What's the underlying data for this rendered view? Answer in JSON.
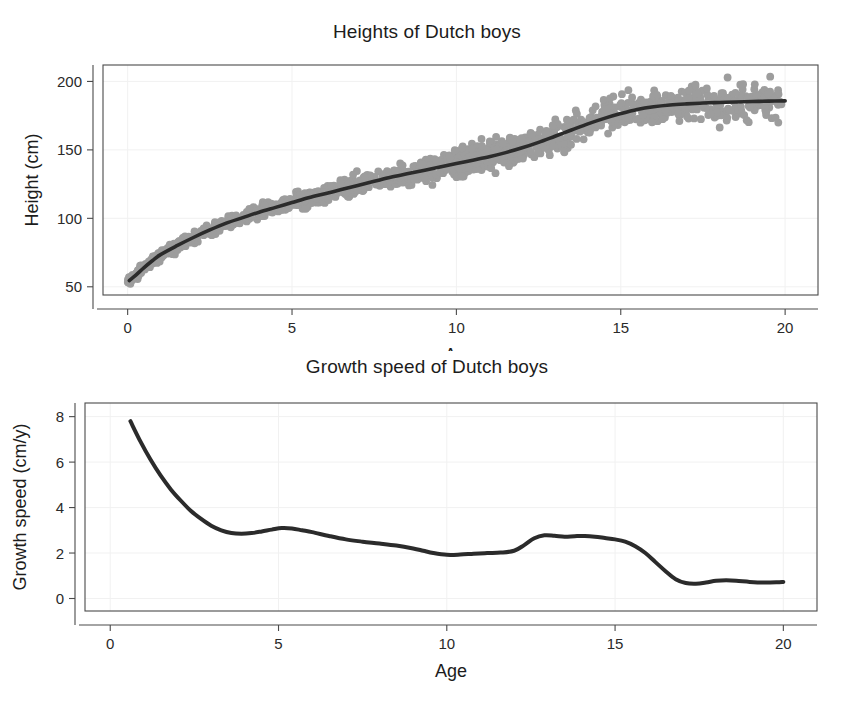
{
  "figure": {
    "background": "#ffffff",
    "width": 854,
    "height": 702
  },
  "colors": {
    "point": "#9d9d9d",
    "curve": "#2b2b2b",
    "axis": "#4a4a4a",
    "grid": "#f1f1f1",
    "text": "#1c1c1c"
  },
  "panels": {
    "heights": {
      "title": "Heights of Dutch boys",
      "xlabel": "Age",
      "ylabel": "Height (cm)",
      "xticks": [
        "0",
        "5",
        "10",
        "15",
        "20"
      ],
      "yticks": [
        "50",
        "100",
        "150",
        "200"
      ]
    },
    "growth": {
      "title": "Growth speed of Dutch boys",
      "xlabel": "Age",
      "ylabel": "Growth speed (cm/y)",
      "xticks": [
        "0",
        "5",
        "10",
        "15",
        "20"
      ],
      "yticks": [
        "0",
        "2",
        "4",
        "6",
        "8"
      ]
    }
  },
  "chart_data": [
    {
      "type": "scatter",
      "id": "heights",
      "title": "Heights of Dutch boys",
      "xlabel": "Age",
      "ylabel": "Height (cm)",
      "xlim": [
        -0.75,
        21.0
      ],
      "ylim": [
        44.0,
        212.0
      ],
      "xticks": [
        0,
        5,
        10,
        15,
        20
      ],
      "yticks": [
        50,
        100,
        150,
        200
      ],
      "grid": true,
      "legend": "none",
      "point_color": "#9d9d9d",
      "point_size": 4.0,
      "series": [
        {
          "name": "Fitted smooth (height vs age)",
          "type": "line",
          "color": "#2b2b2b",
          "x": [
            0.05,
            0.25,
            0.5,
            0.75,
            1.0,
            1.5,
            2.0,
            2.5,
            3.0,
            3.5,
            4.0,
            4.5,
            5.0,
            5.5,
            6.0,
            6.5,
            7.0,
            7.5,
            8.0,
            8.5,
            9.0,
            9.5,
            10.0,
            10.5,
            11.0,
            11.5,
            12.0,
            12.5,
            13.0,
            13.5,
            14.0,
            14.5,
            15.0,
            15.5,
            16.0,
            16.5,
            17.0,
            17.5,
            18.0,
            18.5,
            19.0,
            19.5,
            20.0
          ],
          "y": [
            54.5,
            58.5,
            64.0,
            69.0,
            73.5,
            80.0,
            86.0,
            91.5,
            96.5,
            100.5,
            104.5,
            108.0,
            111.5,
            115.0,
            118.0,
            121.0,
            124.0,
            127.0,
            130.0,
            132.5,
            135.0,
            137.5,
            140.0,
            142.5,
            145.0,
            148.0,
            151.5,
            155.5,
            160.0,
            164.5,
            169.0,
            173.0,
            176.5,
            179.5,
            181.5,
            182.8,
            183.6,
            184.2,
            184.6,
            185.0,
            185.3,
            185.6,
            185.8
          ]
        },
        {
          "name": "Observed boys (scatter, n≈1400)",
          "type": "scatter",
          "color": "#9d9d9d",
          "note": "Individual measurements scattered around the fitted curve; spread grows with age, roughly +/-4 cm at age 1 and +/-9 cm after age 14."
        }
      ]
    },
    {
      "type": "line",
      "id": "growth",
      "title": "Growth speed of Dutch boys",
      "xlabel": "Age",
      "ylabel": "Growth speed (cm/y)",
      "xlim": [
        -0.75,
        21.0
      ],
      "ylim": [
        -0.55,
        8.6
      ],
      "xticks": [
        0,
        5,
        10,
        15,
        20
      ],
      "yticks": [
        0,
        2,
        4,
        6,
        8
      ],
      "grid": true,
      "legend": "none",
      "series": [
        {
          "name": "Growth velocity (derivative of fitted height curve)",
          "color": "#2b2b2b",
          "x": [
            0.6,
            0.9,
            1.2,
            1.5,
            1.8,
            2.1,
            2.4,
            2.7,
            3.0,
            3.3,
            3.6,
            3.9,
            4.2,
            4.5,
            4.8,
            5.1,
            5.4,
            5.7,
            6.0,
            6.5,
            7.0,
            7.5,
            8.0,
            8.5,
            9.0,
            9.3,
            9.6,
            10.0,
            10.4,
            10.8,
            11.2,
            11.6,
            12.0,
            12.3,
            12.6,
            12.9,
            13.2,
            13.5,
            13.8,
            14.1,
            14.4,
            14.7,
            15.0,
            15.3,
            15.6,
            15.9,
            16.2,
            16.5,
            16.8,
            17.1,
            17.4,
            17.7,
            18.0,
            18.3,
            18.6,
            19.0,
            19.4,
            19.8,
            20.0
          ],
          "y": [
            7.8,
            6.9,
            6.1,
            5.4,
            4.8,
            4.3,
            3.85,
            3.5,
            3.2,
            3.0,
            2.88,
            2.85,
            2.88,
            2.95,
            3.03,
            3.1,
            3.08,
            3.0,
            2.92,
            2.75,
            2.6,
            2.5,
            2.42,
            2.33,
            2.2,
            2.1,
            2.0,
            1.92,
            1.93,
            1.97,
            2.0,
            2.02,
            2.1,
            2.35,
            2.65,
            2.78,
            2.76,
            2.72,
            2.74,
            2.75,
            2.72,
            2.66,
            2.6,
            2.5,
            2.3,
            2.0,
            1.6,
            1.2,
            0.85,
            0.68,
            0.65,
            0.7,
            0.78,
            0.8,
            0.78,
            0.73,
            0.7,
            0.71,
            0.73
          ]
        }
      ]
    }
  ]
}
